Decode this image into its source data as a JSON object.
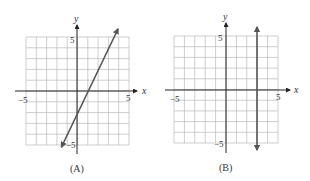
{
  "chart_data": [
    {
      "type": "line",
      "caption": "(A)",
      "xlabel": "x",
      "ylabel": "y",
      "xlim": [
        -5,
        5
      ],
      "ylim": [
        -5,
        5
      ],
      "grid": true,
      "x_ticks_labeled": [
        "-5",
        "5"
      ],
      "y_ticks_labeled": [
        "5",
        "-5"
      ],
      "series": [
        {
          "name": "line A",
          "equation": "y = 2x - 2",
          "x": [
            -1.5,
            4
          ],
          "y": [
            -5,
            6
          ],
          "arrows": "both"
        }
      ]
    },
    {
      "type": "line",
      "caption": "(B)",
      "xlabel": "x",
      "ylabel": "y",
      "xlim": [
        -5,
        5
      ],
      "ylim": [
        -5,
        5
      ],
      "grid": true,
      "x_ticks_labeled": [
        "-5",
        "5"
      ],
      "y_ticks_labeled": [
        "5",
        "-5"
      ],
      "series": [
        {
          "name": "line B",
          "equation": "x = 3",
          "x": [
            3,
            3
          ],
          "y": [
            -5.5,
            6
          ],
          "arrows": "both"
        }
      ]
    }
  ],
  "labels": {
    "a": {
      "caption": "(A)",
      "x_axis": "x",
      "y_axis": "y",
      "xmin": "−5",
      "xmax": "5",
      "ymax": "5",
      "ymin": "−5"
    },
    "b": {
      "caption": "(B)",
      "x_axis": "x",
      "y_axis": "y",
      "xmin": "−5",
      "xmax": "5",
      "ymax": "5",
      "ymin": "−5"
    }
  }
}
